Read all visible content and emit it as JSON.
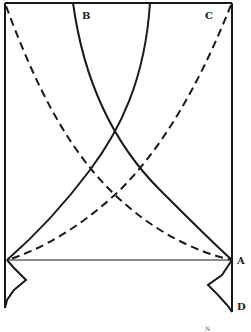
{
  "diagram": {
    "type": "line-drawing",
    "labels": {
      "B": "B",
      "C": "C",
      "A": "A",
      "D": "D",
      "corner_mark": "N"
    },
    "colors": {
      "stroke": "#1a1a1a",
      "background": "#ffffff"
    },
    "elements": [
      {
        "name": "frame",
        "style": "solid"
      },
      {
        "name": "solid-curve-from-B-to-A",
        "style": "solid"
      },
      {
        "name": "solid-curve-from-top-to-left-base",
        "style": "solid"
      },
      {
        "name": "dashed-curve-top-left-to-A",
        "style": "dashed"
      },
      {
        "name": "dashed-curve-C-to-left-base",
        "style": "dashed"
      },
      {
        "name": "baseline",
        "style": "thin solid"
      },
      {
        "name": "left-zigzag",
        "style": "solid"
      },
      {
        "name": "right-zigzag",
        "style": "solid"
      }
    ]
  }
}
